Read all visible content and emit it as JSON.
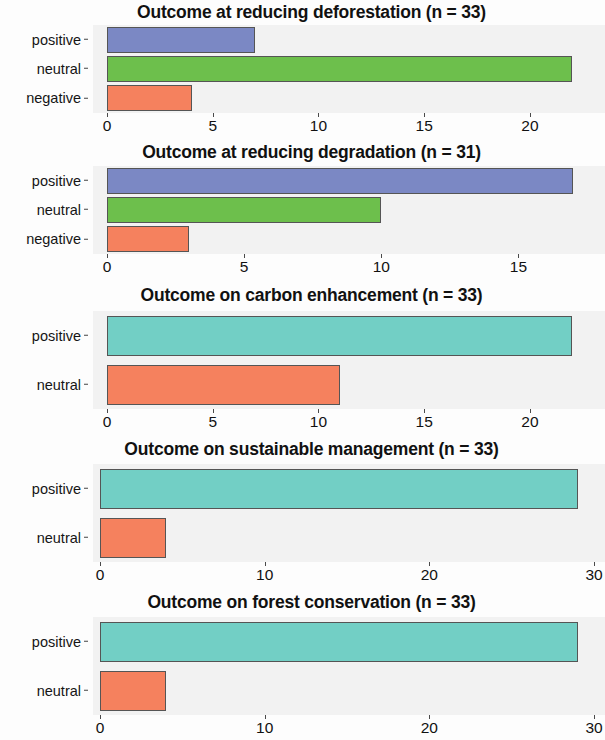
{
  "figure": {
    "background": "#fdfdfd",
    "panel_background": "#f2f2f2",
    "bar_border": "#555555"
  },
  "colors": {
    "positive_blue": "#7b88c4",
    "neutral_green": "#6dbf4c",
    "negative_orange": "#f5815e",
    "positive_teal": "#72cfc5",
    "neutral_orange": "#f5815e"
  },
  "chart_data": [
    {
      "type": "bar",
      "orientation": "horizontal",
      "title": "Outcome at reducing deforestation (n = 33)",
      "xlabel": "",
      "ylabel": "",
      "categories": [
        "positive",
        "neutral",
        "negative"
      ],
      "values": [
        7,
        22,
        4
      ],
      "bar_colors": [
        "#7b88c4",
        "#6dbf4c",
        "#f5815e"
      ],
      "xlim": [
        0,
        22.7
      ],
      "xticks": [
        0,
        5,
        10,
        15,
        20
      ],
      "xtick_labels": [
        "0",
        "5",
        "10",
        "15",
        "20"
      ],
      "grid": false,
      "legend": "none"
    },
    {
      "type": "bar",
      "orientation": "horizontal",
      "title": "Outcome at reducing degradation (n = 31)",
      "xlabel": "",
      "ylabel": "",
      "categories": [
        "positive",
        "neutral",
        "negative"
      ],
      "values": [
        17,
        10,
        3
      ],
      "bar_colors": [
        "#7b88c4",
        "#6dbf4c",
        "#f5815e"
      ],
      "xlim": [
        0,
        17.5
      ],
      "xticks": [
        0,
        5,
        10,
        15
      ],
      "xtick_labels": [
        "0",
        "5",
        "10",
        "15"
      ],
      "grid": false,
      "legend": "none"
    },
    {
      "type": "bar",
      "orientation": "horizontal",
      "title": "Outcome on carbon enhancement (n = 33)",
      "xlabel": "",
      "ylabel": "",
      "categories": [
        "positive",
        "neutral"
      ],
      "values": [
        22,
        11
      ],
      "bar_colors": [
        "#72cfc5",
        "#f5815e"
      ],
      "xlim": [
        0,
        22.7
      ],
      "xticks": [
        0,
        5,
        10,
        15,
        20
      ],
      "xtick_labels": [
        "0",
        "5",
        "10",
        "15",
        "20"
      ],
      "grid": false,
      "legend": "none"
    },
    {
      "type": "bar",
      "orientation": "horizontal",
      "title": "Outcome on sustainable management (n = 33)",
      "xlabel": "",
      "ylabel": "",
      "categories": [
        "positive",
        "neutral"
      ],
      "values": [
        29,
        4
      ],
      "bar_colors": [
        "#72cfc5",
        "#f5815e"
      ],
      "xlim": [
        0,
        30
      ],
      "xticks": [
        0,
        10,
        20,
        30
      ],
      "xtick_labels": [
        "0",
        "10",
        "20",
        "30"
      ],
      "grid": false,
      "legend": "none"
    },
    {
      "type": "bar",
      "orientation": "horizontal",
      "title": "Outcome on forest conservation (n = 33)",
      "xlabel": "",
      "ylabel": "",
      "categories": [
        "positive",
        "neutral"
      ],
      "values": [
        29,
        4
      ],
      "bar_colors": [
        "#72cfc5",
        "#f5815e"
      ],
      "xlim": [
        0,
        30
      ],
      "xticks": [
        0,
        10,
        20,
        30
      ],
      "xtick_labels": [
        "0",
        "10",
        "20",
        "30"
      ],
      "grid": false,
      "legend": "none"
    }
  ]
}
